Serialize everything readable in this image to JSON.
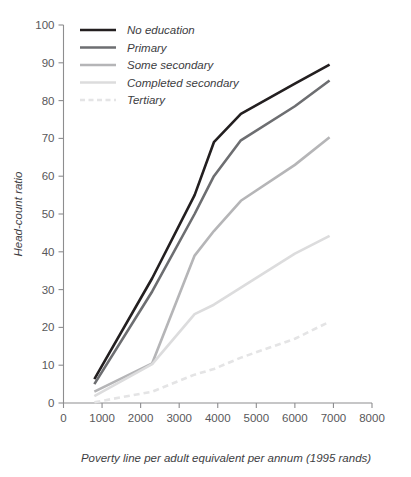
{
  "chart_data": {
    "type": "line",
    "title": "",
    "xlabel": "Poverty line per adult equivalent per annum (1995 rands)",
    "ylabel": "Head-count ratio",
    "xlim": [
      0,
      8000
    ],
    "ylim": [
      0,
      100
    ],
    "xticks": [
      0,
      1000,
      2000,
      3000,
      4000,
      5000,
      6000,
      7000,
      8000
    ],
    "yticks": [
      0,
      10,
      20,
      30,
      40,
      50,
      60,
      70,
      80,
      90,
      100
    ],
    "xtick_labels": [
      "0",
      "1000",
      "2000",
      "3000",
      "4000",
      "5000",
      "6000",
      "7000",
      "8000"
    ],
    "ytick_labels": [
      "0",
      "10",
      "20",
      "30",
      "40",
      "50",
      "60",
      "70",
      "80",
      "90",
      "100"
    ],
    "grid": false,
    "legend_position": "top-left-inside",
    "x": [
      800,
      2300,
      3400,
      3900,
      4600,
      6000,
      6900
    ],
    "series": [
      {
        "name": "No education",
        "color": "#231f20",
        "dash": "none",
        "width": 2.6,
        "values": [
          6.3,
          33.0,
          55.0,
          69.0,
          76.5,
          84.5,
          89.5
        ]
      },
      {
        "name": "Primary",
        "color": "#6d6e71",
        "dash": "none",
        "width": 2.6,
        "values": [
          5.0,
          29.5,
          50.0,
          60.0,
          69.5,
          78.5,
          85.3
        ]
      },
      {
        "name": "Some secondary",
        "color": "#b5b5b7",
        "dash": "none",
        "width": 2.6,
        "values": [
          3.0,
          10.5,
          39.0,
          45.5,
          53.5,
          63.0,
          70.3
        ]
      },
      {
        "name": "Completed secondary",
        "color": "#dcdcdd",
        "dash": "none",
        "width": 2.6,
        "values": [
          1.8,
          10.3,
          23.5,
          26.0,
          30.5,
          39.5,
          44.2
        ]
      },
      {
        "name": "Tertiary",
        "color": "#e4e4e5",
        "dash": "6 4",
        "width": 2.6,
        "values": [
          0.2,
          3.0,
          7.5,
          9.0,
          12.0,
          17.0,
          21.5
        ]
      }
    ]
  },
  "axes": {
    "x_title": "Poverty line per adult equivalent per annum (1995 rands)",
    "y_title": "Head-count ratio"
  },
  "legend": {
    "entries": [
      {
        "label": "No education"
      },
      {
        "label": "Primary"
      },
      {
        "label": "Some secondary"
      },
      {
        "label": "Completed secondary"
      },
      {
        "label": "Tertiary"
      }
    ]
  }
}
